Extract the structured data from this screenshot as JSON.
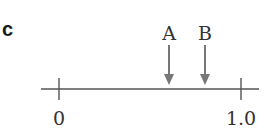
{
  "panel_label": "c",
  "axis": {
    "min_label": "0",
    "max_label": "1.0",
    "min": 0,
    "max": 1.0
  },
  "markers": [
    {
      "label": "A",
      "value": 0.6
    },
    {
      "label": "B",
      "value": 0.8
    }
  ],
  "colors": {
    "axis": "#555555",
    "arrow": "#777777",
    "text": "#333333"
  }
}
